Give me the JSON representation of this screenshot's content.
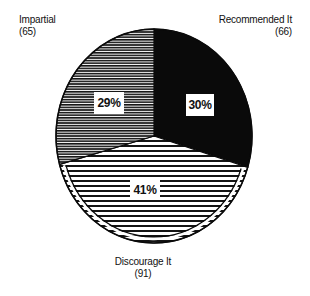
{
  "chart_data": {
    "type": "pie",
    "title": "",
    "categories": [
      "Recommended It",
      "Discourage It",
      "Impartial"
    ],
    "values": [
      66,
      91,
      65
    ],
    "percentages": [
      30,
      41,
      29
    ],
    "percent_labels": [
      "30%",
      "41%",
      "29%"
    ],
    "count_labels": [
      "(66)",
      "(91)",
      "(65)"
    ],
    "total": 222,
    "start_angle_deg": 0,
    "direction": "clockwise from 12 o'clock",
    "fills": {
      "Recommended It": "solid black",
      "Discourage It": "wide horizontal stripes",
      "Impartial": "fine horizontal stripes"
    },
    "legend": "none (direct slice labels)"
  },
  "labels": {
    "impartial": {
      "name": "Impartial",
      "count": "(65)",
      "pct": "29%"
    },
    "recommended": {
      "name": "Recommended It",
      "count": "(66)",
      "pct": "30%"
    },
    "discourage": {
      "name": "Discourage It",
      "count": "(91)",
      "pct": "41%"
    }
  },
  "colors": {
    "ink": "#0a0a0a",
    "paper": "#ffffff"
  }
}
